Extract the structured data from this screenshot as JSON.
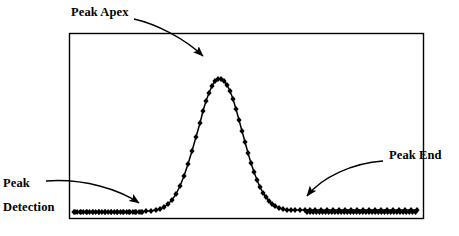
{
  "figure": {
    "title": "",
    "background_color": "#ffffff",
    "frame": {
      "x": 69,
      "y": 33,
      "width": 355,
      "height": 186,
      "border_color": "#000000",
      "border_width": 1.4
    }
  },
  "annotations": {
    "peak_apex": {
      "label": "Peak Apex",
      "target_x": 209,
      "target_y": 64
    },
    "peak_detection": {
      "label_line1": "Peak",
      "label_line2": "Detection",
      "target_x": 146,
      "target_y": 208
    },
    "peak_end": {
      "label": "Peak End",
      "target_x": 304,
      "target_y": 201
    }
  },
  "chart_data": {
    "type": "line",
    "title": "",
    "xlabel": "",
    "ylabel": "",
    "grid": false,
    "legend": "none",
    "marker": "diamond",
    "marker_color": "#000000",
    "line_color": "#000000",
    "xlim": [
      0,
      355
    ],
    "ylim": [
      0,
      186
    ],
    "series": [
      {
        "name": "chromatogram",
        "x": [
          6,
          12,
          18,
          24,
          30,
          36,
          42,
          48,
          54,
          60,
          66,
          72,
          77,
          82,
          87,
          91,
          95,
          99,
          103,
          107,
          111,
          115,
          119,
          123,
          127,
          131,
          134,
          137,
          140,
          143,
          146,
          149,
          152,
          155,
          158,
          161,
          164,
          167,
          170,
          173,
          176,
          179,
          182,
          185,
          188,
          191,
          194,
          197,
          200,
          203,
          206,
          210,
          214,
          218,
          222,
          226,
          231,
          236,
          241,
          246,
          252,
          258,
          264,
          270,
          276,
          282,
          288,
          294,
          300,
          306,
          312,
          318,
          324,
          330,
          336,
          342,
          348
        ],
        "y": [
          7,
          7,
          7,
          7,
          7,
          7,
          7,
          7,
          7,
          7,
          7,
          7,
          8,
          8,
          9,
          10,
          12,
          15,
          19,
          25,
          33,
          43,
          55,
          68,
          82,
          96,
          108,
          118,
          126,
          133,
          138,
          140,
          140,
          138,
          134,
          128,
          120,
          110,
          99,
          88,
          77,
          66,
          56,
          47,
          39,
          32,
          26,
          22,
          18,
          15,
          13,
          11,
          10,
          9,
          9,
          9,
          9,
          9,
          9,
          9,
          9,
          9,
          9,
          9,
          9,
          9,
          9,
          9,
          9,
          9,
          9,
          9,
          9,
          9,
          9,
          9,
          9
        ]
      }
    ],
    "peak": {
      "apex_x": 140,
      "apex_y": 140,
      "start_x": 77,
      "end_x": 236,
      "baseline_y": 7
    }
  }
}
